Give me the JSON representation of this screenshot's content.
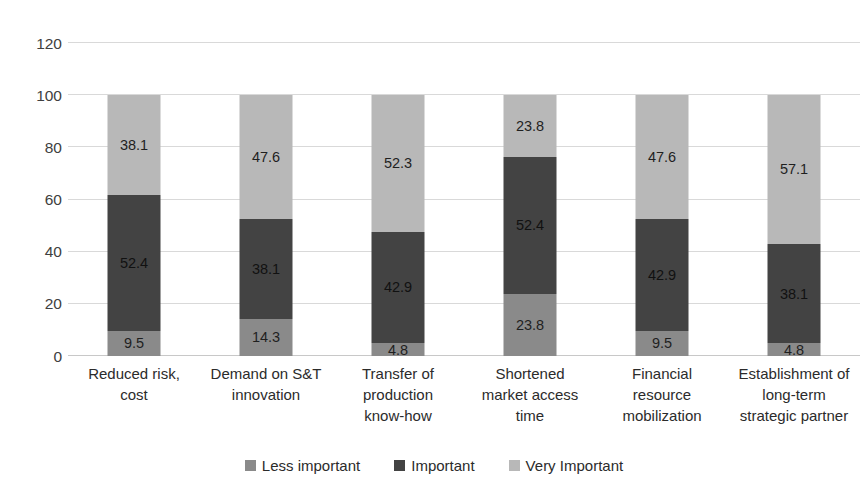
{
  "chart_data": {
    "type": "bar",
    "subtype": "stacked-bar-100",
    "title": "",
    "xlabel": "",
    "ylabel": "",
    "ylim": [
      0,
      120
    ],
    "yticks": [
      0,
      20,
      40,
      60,
      80,
      100,
      120
    ],
    "ytick_labels": [
      "0",
      "20",
      "40",
      "60",
      "80",
      "100",
      "120"
    ],
    "grid": true,
    "legend_position": "bottom",
    "categories": [
      "Reduced risk, cost",
      "Demand on S&T innovation",
      "Transfer of production know-how",
      "Shortened market access time",
      "Financial resource mobilization",
      "Establishment of long-term strategic partner"
    ],
    "category_lines": [
      [
        "Reduced risk,",
        "cost"
      ],
      [
        "Demand on S&T",
        "innovation"
      ],
      [
        "Transfer of",
        "production",
        "know-how"
      ],
      [
        "Shortened",
        "market access",
        "time"
      ],
      [
        "Financial",
        "resource",
        "mobilization"
      ],
      [
        "Establishment of",
        "long-term",
        "strategic partner"
      ]
    ],
    "series": [
      {
        "name": "Less important",
        "color": "#8a8a8a",
        "values": [
          9.5,
          14.3,
          4.8,
          23.8,
          9.5,
          4.8
        ],
        "labels": [
          "9.5",
          "14.3",
          "4.8",
          "23.8",
          "9.5",
          "4.8"
        ]
      },
      {
        "name": "Important",
        "color": "#434343",
        "values": [
          52.4,
          38.1,
          42.9,
          52.4,
          42.9,
          38.1
        ],
        "labels": [
          "52.4",
          "38.1",
          "42.9",
          "52.4",
          "42.9",
          "38.1"
        ]
      },
      {
        "name": "Very Important",
        "color": "#b8b8b8",
        "values": [
          38.1,
          47.6,
          52.3,
          23.8,
          47.6,
          57.1
        ],
        "labels": [
          "38.1",
          "47.6",
          "52.3",
          "23.8",
          "47.6",
          "57.1"
        ]
      }
    ],
    "totals": [
      100,
      100,
      100,
      100,
      100,
      100
    ]
  },
  "legend": {
    "items": [
      {
        "label": "Less important",
        "color": "#8a8a8a"
      },
      {
        "label": "Important",
        "color": "#434343"
      },
      {
        "label": "Very Important",
        "color": "#b8b8b8"
      }
    ]
  },
  "axis": {
    "gridline_color": "#d9d9d9",
    "baseline_color": "#c8c8c8",
    "tick_text_color": "#404040"
  }
}
